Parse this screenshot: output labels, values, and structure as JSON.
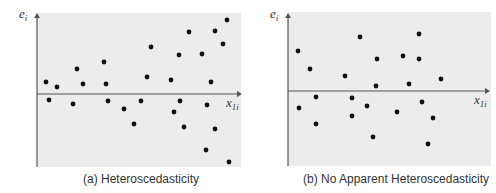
{
  "chart_data": [
    {
      "type": "scatter",
      "title": "(a) Heteroscedasticity",
      "xlabel": "x1i",
      "ylabel": "ei",
      "grid": false,
      "axes": {
        "origin_px": [
          37,
          94
        ],
        "x_end_px": 241,
        "y_top_px": 14,
        "y_bottom_px": 167,
        "bg": [
          37,
          13,
          204,
          154
        ]
      },
      "points_px": [
        [
          46,
          82
        ],
        [
          49,
          100
        ],
        [
          57,
          87
        ],
        [
          77,
          69
        ],
        [
          73,
          104
        ],
        [
          83,
          84
        ],
        [
          104,
          62
        ],
        [
          106,
          84
        ],
        [
          108,
          101
        ],
        [
          124,
          109
        ],
        [
          134,
          124
        ],
        [
          141,
          101
        ],
        [
          151,
          47
        ],
        [
          147,
          77
        ],
        [
          171,
          80
        ],
        [
          179,
          55
        ],
        [
          180,
          101
        ],
        [
          174,
          112
        ],
        [
          184,
          127
        ],
        [
          189,
          32
        ],
        [
          202,
          54
        ],
        [
          211,
          82
        ],
        [
          207,
          105
        ],
        [
          215,
          129
        ],
        [
          206,
          150
        ],
        [
          215,
          31
        ],
        [
          223,
          44
        ],
        [
          227,
          20
        ],
        [
          229,
          162
        ]
      ]
    },
    {
      "type": "scatter",
      "title": "(b) No Apparent Heteroscedasticity",
      "xlabel": "x1i",
      "ylabel": "ei",
      "grid": false,
      "axes": {
        "origin_px": [
          288,
          91
        ],
        "x_end_px": 489,
        "y_top_px": 14,
        "y_bottom_px": 166,
        "bg": [
          288,
          12,
          203,
          154
        ]
      },
      "points_px": [
        [
          298,
          51
        ],
        [
          310,
          69
        ],
        [
          299,
          108
        ],
        [
          316,
          97
        ],
        [
          316,
          124
        ],
        [
          345,
          76
        ],
        [
          360,
          37
        ],
        [
          352,
          98
        ],
        [
          352,
          116
        ],
        [
          377,
          59
        ],
        [
          376,
          86
        ],
        [
          367,
          106
        ],
        [
          373,
          137
        ],
        [
          419,
          34
        ],
        [
          403,
          56
        ],
        [
          419,
          59
        ],
        [
          409,
          84
        ],
        [
          441,
          79
        ],
        [
          422,
          102
        ],
        [
          397,
          112
        ],
        [
          433,
          118
        ],
        [
          428,
          144
        ]
      ]
    }
  ],
  "panels": {
    "a": {
      "caption": "(a) Heteroscedasticity",
      "ylabel": "e",
      "ylabel_sub": "i",
      "xlabel": "x",
      "xlabel_sub": "1i"
    },
    "b": {
      "caption": "(b) No Apparent Heteroscedasticity",
      "ylabel": "e",
      "ylabel_sub": "i",
      "xlabel": "x",
      "xlabel_sub": "1i"
    }
  },
  "colors": {
    "plot_bg": "#ececec",
    "axis": "#555555",
    "point": "#111111"
  }
}
